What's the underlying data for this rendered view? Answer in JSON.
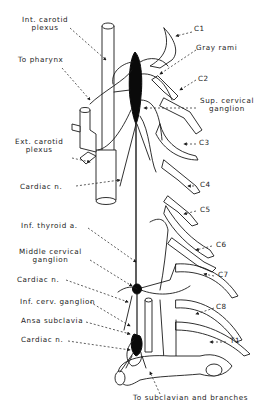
{
  "figure": {
    "type": "anatomical line drawing",
    "colors": {
      "ink": "#1a1a1a",
      "background": "#ffffff",
      "ganglion_fill": "#0a0a0a"
    }
  },
  "labels": {
    "int_carotid_plexus_1": "Int. carotid",
    "int_carotid_plexus_2": "plexus",
    "to_pharynx": "To pharynx",
    "ext_carotid_plexus_1": "Ext. carotid",
    "ext_carotid_plexus_2": "plexus",
    "cardiac_n_upper": "Cardiac n.",
    "inf_thyroid_a": "Inf. thyroid a.",
    "middle_cervical_ganglion_1": "Middle cervical",
    "middle_cervical_ganglion_2": "ganglion",
    "cardiac_n_middle": "Cardiac n.",
    "inf_cerv_ganglion": "Inf. cerv. ganglion",
    "ansa_subclavia": "Ansa subclavia",
    "cardiac_n_lower": "Cardiac n.",
    "to_subclavian": "To subclavian and branches",
    "c1": "C1",
    "gray_rami": "Gray rami",
    "c2": "C2",
    "sup_cervical_ganglion_1": "Sup. cervical",
    "sup_cervical_ganglion_2": "ganglion",
    "c3": "C3",
    "c4": "C4",
    "c5": "C5",
    "c6": "C6",
    "c7": "C7",
    "c8": "C8",
    "t1": "T1"
  }
}
